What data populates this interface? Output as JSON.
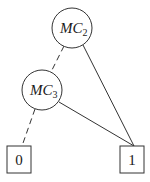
{
  "diagram": {
    "type": "binary-decision-diagram",
    "nodes": [
      {
        "id": "mc2",
        "label_main": "MC",
        "label_sub": "2",
        "shape": "circle",
        "cx": 72,
        "cy": 28,
        "r": 20
      },
      {
        "id": "mc3",
        "label_main": "MC",
        "label_sub": "3",
        "shape": "circle",
        "cx": 42,
        "cy": 90,
        "r": 20
      }
    ],
    "terminals": [
      {
        "id": "t0",
        "label": "0",
        "shape": "square",
        "x": 7,
        "y": 146,
        "w": 24,
        "h": 27
      },
      {
        "id": "t1",
        "label": "1",
        "shape": "square",
        "x": 120,
        "y": 146,
        "w": 24,
        "h": 27
      }
    ],
    "edges": [
      {
        "from": "mc2",
        "to": "mc3",
        "style": "dashed"
      },
      {
        "from": "mc2",
        "to": "t1",
        "style": "solid"
      },
      {
        "from": "mc3",
        "to": "t0",
        "style": "dashed"
      },
      {
        "from": "mc3",
        "to": "t1",
        "style": "solid"
      }
    ],
    "colors": {
      "stroke": "#333333",
      "background": "#ffffff"
    }
  }
}
